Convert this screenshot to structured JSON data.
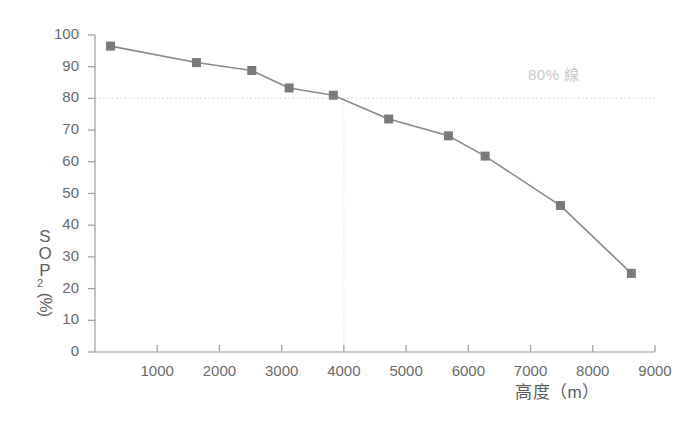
{
  "chart_data": {
    "type": "line",
    "title": "",
    "subtitle": "",
    "xlabel": "高度（m）",
    "ylabel": "SPO2（%）",
    "ylabel_chars": [
      "S",
      "O",
      "P"
    ],
    "ylabel_sub": "2",
    "ylabel_rot": "(%)",
    "xlim": [
      0,
      9000
    ],
    "ylim": [
      0,
      100
    ],
    "grid": false,
    "legend": "none",
    "x": [
      250,
      1630,
      2520,
      3120,
      3830,
      4720,
      5680,
      6270,
      7480,
      8620
    ],
    "values": [
      96.5,
      91.3,
      88.8,
      83.3,
      81.0,
      73.5,
      68.2,
      61.8,
      46.2,
      24.8
    ],
    "series": [
      {
        "name": "SpO2",
        "x": [
          250,
          1630,
          2520,
          3120,
          3830,
          4720,
          5680,
          6270,
          7480,
          8620
        ],
        "values": [
          96.5,
          91.3,
          88.8,
          83.3,
          81.0,
          73.5,
          68.2,
          61.8,
          46.2,
          24.8
        ]
      }
    ],
    "xticks": [
      1000,
      2000,
      3000,
      4000,
      5000,
      6000,
      7000,
      8000,
      9000
    ],
    "xtick_labels": [
      "1000",
      "2000",
      "3000",
      "4000",
      "5000",
      "6000",
      "7000",
      "8000",
      "9000"
    ],
    "yticks": [
      0,
      10,
      20,
      30,
      40,
      50,
      60,
      70,
      80,
      90,
      100
    ],
    "ytick_labels": [
      "0",
      "10",
      "20",
      "30",
      "40",
      "50",
      "60",
      "70",
      "80",
      "90",
      "100"
    ],
    "annotations": [
      {
        "name": "threshold-80-percent",
        "text": "80% 線",
        "y_value": 80,
        "x_value": 4000,
        "style": "dotted"
      }
    ],
    "colors": {
      "line": "#8a8a8a",
      "marker": "#7a7a7a",
      "axis": "#9a9a9a",
      "text": "#6b6b6b",
      "annotation": "#c9c9c9",
      "dotted": "#d8d8d8",
      "background": "#ffffff"
    }
  },
  "axis": {
    "x_title": "高度（m）",
    "y_title_chars": [
      "S",
      "O",
      "P"
    ],
    "y_title_sub": "2",
    "y_title_paren": "(%)"
  },
  "annotation": {
    "threshold_label": "80% 線"
  }
}
